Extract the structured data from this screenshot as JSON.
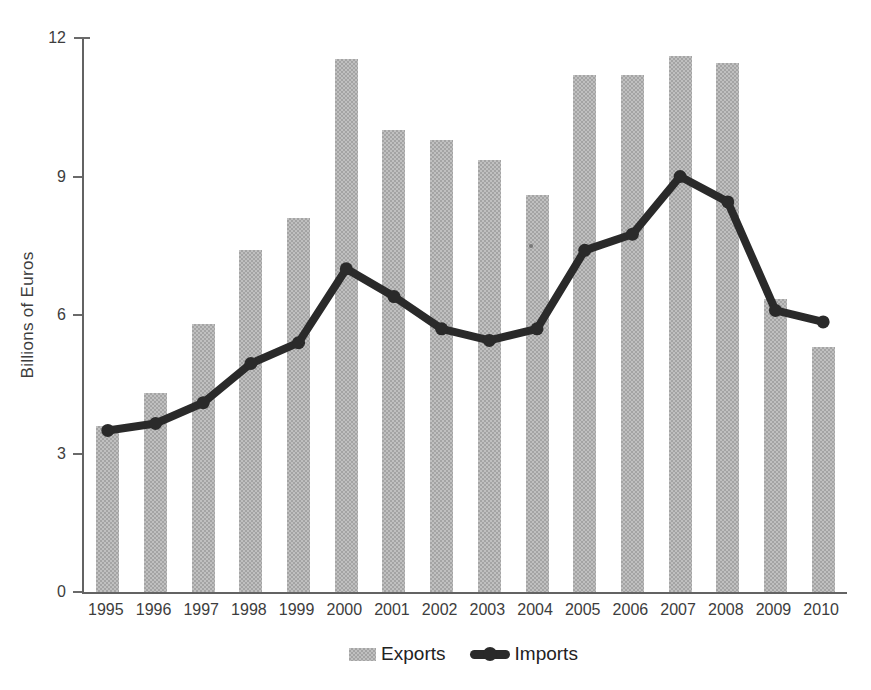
{
  "chart_data": {
    "type": "bar+line",
    "title": "",
    "xlabel": "",
    "ylabel": "Billions of Euros",
    "ylim": [
      0,
      12
    ],
    "yticks": [
      0,
      3,
      6,
      9,
      12
    ],
    "grid": false,
    "legend_position": "bottom-center",
    "categories": [
      "1995",
      "1996",
      "1997",
      "1998",
      "1999",
      "2000",
      "2001",
      "2002",
      "2003",
      "2004",
      "2005",
      "2006",
      "2007",
      "2008",
      "2009",
      "2010"
    ],
    "series": [
      {
        "name": "Exports",
        "type": "bar",
        "color": "#b3b3b3",
        "values": [
          3.6,
          4.3,
          5.8,
          7.4,
          8.1,
          11.55,
          10.0,
          9.8,
          9.35,
          8.6,
          11.2,
          11.2,
          11.6,
          11.45,
          6.35,
          5.3
        ]
      },
      {
        "name": "Imports",
        "type": "line",
        "color": "#2a2a2a",
        "values": [
          3.5,
          3.65,
          4.1,
          4.95,
          5.4,
          7.0,
          6.4,
          5.7,
          5.45,
          5.7,
          7.4,
          7.75,
          9.0,
          8.45,
          6.1,
          5.85
        ]
      }
    ]
  },
  "axis": {
    "ylabel": "Billions of Euros",
    "ytick_labels": [
      "0",
      "3",
      "6",
      "9",
      "12"
    ]
  },
  "legend": {
    "exports_label": "Exports",
    "imports_label": "Imports"
  }
}
